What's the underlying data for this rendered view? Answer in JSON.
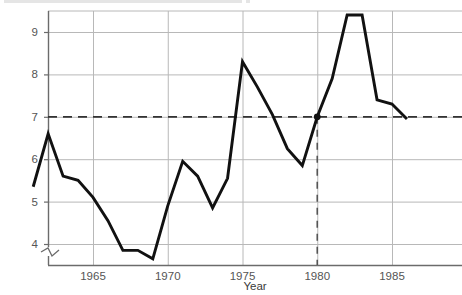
{
  "chart_data": {
    "type": "line",
    "title": "",
    "xlabel": "Year",
    "ylabel": "",
    "xlim": [
      1960.5,
      1986.5
    ],
    "ylim": [
      3.45,
      9.9
    ],
    "grid": true,
    "legend": false,
    "x": [
      1961,
      1962,
      1963,
      1964,
      1965,
      1966,
      1967,
      1968,
      1969,
      1970,
      1971,
      1972,
      1973,
      1974,
      1975,
      1976,
      1977,
      1978,
      1979,
      1980,
      1981,
      1982,
      1983,
      1984,
      1985,
      1986
    ],
    "values": [
      5.35,
      6.6,
      5.6,
      5.5,
      5.1,
      4.55,
      3.85,
      3.85,
      3.65,
      4.9,
      5.95,
      5.6,
      4.85,
      5.55,
      8.3,
      7.7,
      7.05,
      6.25,
      5.85,
      7.0,
      7.9,
      9.4,
      9.4,
      7.4,
      7.3,
      6.95
    ],
    "x_ticks": [
      1965,
      1970,
      1975,
      1980,
      1985
    ],
    "x_tick_labels": [
      "1965",
      "1970",
      "1975",
      "1980",
      "1985"
    ],
    "y_ticks": [
      4,
      5,
      6,
      7,
      8,
      9
    ],
    "y_tick_labels": [
      "4",
      "5",
      "6",
      "7",
      "8",
      "9"
    ],
    "annotations": [
      {
        "name": "reference-line-horizontal",
        "type": "hline",
        "y": 7.0,
        "style": "dashed"
      },
      {
        "name": "reference-line-vertical",
        "type": "vline",
        "x": 1980,
        "style": "dashed"
      },
      {
        "name": "highlight-marker",
        "type": "point",
        "x": 1980,
        "y": 7.0
      }
    ],
    "axis_break": {
      "axis": "y",
      "present": true,
      "position": 3.6
    },
    "series_color": "#111111",
    "grid_color": "#b8b8b8",
    "axis_color": "#6b6b6b",
    "reference_color": "#333333"
  },
  "labels": {
    "clipped_top_text": ""
  }
}
